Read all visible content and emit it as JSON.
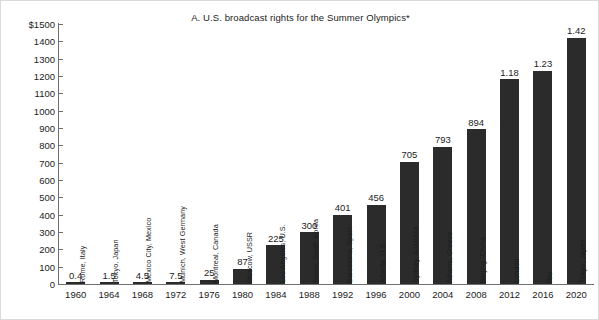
{
  "chart_data": {
    "type": "bar",
    "title": "A.  U.S. broadcast rights for the Summer Olympics*",
    "xlabel": "",
    "ylabel": "",
    "ylim": [
      0,
      1500
    ],
    "ytick_step": 100,
    "ytick_labels": [
      "$1500",
      "1400",
      "1300",
      "1200",
      "1100",
      "1000",
      "900",
      "800",
      "700",
      "600",
      "500",
      "400",
      "300",
      "200",
      "100",
      "0"
    ],
    "ytick_values": [
      1500,
      1400,
      1300,
      1200,
      1100,
      1000,
      900,
      800,
      700,
      600,
      500,
      400,
      300,
      200,
      100,
      0
    ],
    "grid": false,
    "legend": null,
    "categories": [
      "1960",
      "1964",
      "1968",
      "1972",
      "1976",
      "1980",
      "1984",
      "1988",
      "1992",
      "1996",
      "2000",
      "2004",
      "2008",
      "2012",
      "2016",
      "2020"
    ],
    "values": [
      0.4,
      1.5,
      4.5,
      7.5,
      25,
      87,
      225,
      300,
      401,
      456,
      705,
      793,
      894,
      1180,
      1230,
      1420
    ],
    "value_labels": [
      "0.4",
      "1.5",
      "4.5",
      "7.5",
      "25",
      "87",
      "225",
      "300",
      "401",
      "456",
      "705",
      "793",
      "894",
      "1.18",
      "1.23",
      "1.42"
    ],
    "point_labels": [
      "Rome, Italy",
      "Tokyo, Japan",
      "Mexico City, Mexico",
      "Munich, West Germany",
      "Montreal, Canada",
      "Moscow, USSR",
      "Los Angeles, U.S.",
      "Seoul, South Korea",
      "Barcelona, Spain",
      "Atlanta, U.S.",
      "Sydney, Australia",
      "Athens, Greece",
      "Beijing, China",
      "London",
      "Rio",
      "Tokyo, Japan"
    ],
    "bar_color": "#2b2b2b",
    "axis_color": "#6f6f6f",
    "text_color": "#1c1c1c"
  }
}
